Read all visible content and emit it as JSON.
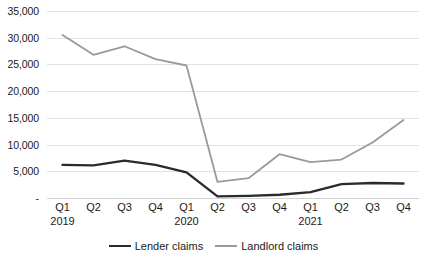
{
  "chart_data": {
    "type": "line",
    "title": "",
    "subtitle": "",
    "xlabel": "",
    "ylabel": "",
    "ylim": [
      0,
      35000
    ],
    "y_ticks": [
      0,
      5000,
      10000,
      15000,
      20000,
      25000,
      30000,
      35000
    ],
    "y_tick_labels": [
      "-",
      "5,000",
      "10,000",
      "15,000",
      "20,000",
      "25,000",
      "30,000",
      "35,000"
    ],
    "grid": true,
    "legend_position": "bottom",
    "categories": [
      "Q1",
      "Q2",
      "Q3",
      "Q4",
      "Q1",
      "Q2",
      "Q3",
      "Q4",
      "Q1",
      "Q2",
      "Q3",
      "Q4"
    ],
    "group_labels": [
      {
        "label": "2019",
        "at_index": 0
      },
      {
        "label": "2020",
        "at_index": 4
      },
      {
        "label": "2021",
        "at_index": 8
      }
    ],
    "series": [
      {
        "name": "Lender claims",
        "color": "#2b2b2b",
        "values": [
          6200,
          6100,
          7000,
          6200,
          4800,
          300,
          400,
          600,
          1100,
          2600,
          2800,
          2700
        ]
      },
      {
        "name": "Landlord claims",
        "color": "#9a9a9a",
        "values": [
          30500,
          26800,
          28400,
          26000,
          24800,
          3000,
          3700,
          8200,
          6700,
          7200,
          10400,
          14600
        ]
      }
    ]
  },
  "legend": {
    "items": [
      {
        "label": "Lender claims",
        "color": "#2b2b2b"
      },
      {
        "label": "Landlord claims",
        "color": "#9a9a9a"
      }
    ]
  },
  "source_note": {
    "text": ""
  }
}
